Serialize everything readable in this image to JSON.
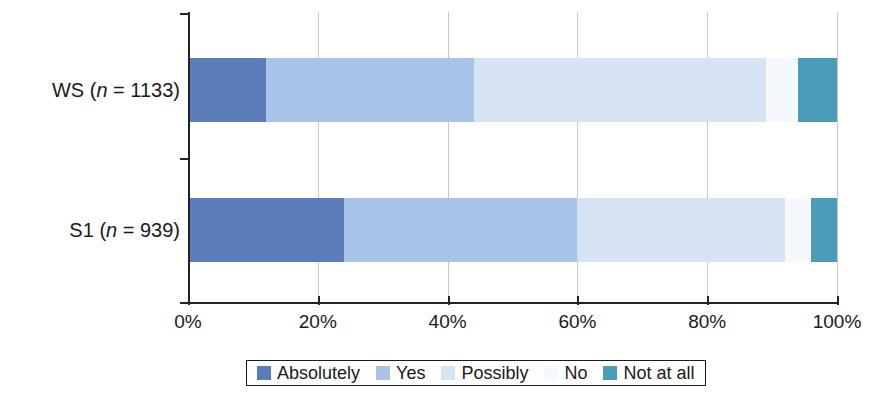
{
  "chart_data": {
    "type": "bar",
    "orientation": "horizontal",
    "stacked": true,
    "stacked_mode": "percent",
    "title": "",
    "subtitle": "",
    "xlabel": "",
    "ylabel": "",
    "xlim": [
      0,
      100
    ],
    "grid": true,
    "grid_axis": "x",
    "legend_position": "bottom",
    "x_tick_labels": [
      "0%",
      "20%",
      "40%",
      "60%",
      "80%",
      "100%"
    ],
    "x_tick_values": [
      0,
      20,
      40,
      60,
      80,
      100
    ],
    "categories": [
      "WS (n = 1133)",
      "S1 (n = 939)"
    ],
    "category_parts": [
      {
        "prefix": "WS (",
        "italic": "n",
        "suffix": " = 1133)"
      },
      {
        "prefix": "S1 (",
        "italic": "n",
        "suffix": " = 939)"
      }
    ],
    "series": [
      {
        "name": "Absolutely",
        "color": "#5a7cb8",
        "values": [
          12,
          24
        ]
      },
      {
        "name": "Yes",
        "color": "#a9c2e8",
        "values": [
          32,
          36
        ]
      },
      {
        "name": "Possibly",
        "color": "#d6e3f2",
        "values": [
          45,
          32
        ]
      },
      {
        "name": "No",
        "color": "#f5f9fd",
        "values": [
          5,
          4
        ]
      },
      {
        "name": "Not at all",
        "color": "#4a9cb8",
        "values": [
          6,
          4
        ]
      }
    ],
    "legend_entries": [
      {
        "label": "Absolutely",
        "color": "#5a7cb8"
      },
      {
        "label": "Yes",
        "color": "#a9c2e8"
      },
      {
        "label": "Possibly",
        "color": "#d6e3f2"
      },
      {
        "label": "No",
        "color": "#f5f9fd"
      },
      {
        "label": "Not at all",
        "color": "#4a9cb8"
      }
    ],
    "axis_color": "#232323",
    "gridline_color": "#c8c8c8",
    "background": "#ffffff"
  }
}
